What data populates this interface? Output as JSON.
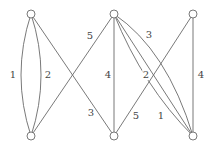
{
  "diagram": {
    "type": "bipartite-multigraph",
    "nodes": [
      {
        "id": "top-left",
        "x": 31,
        "y": 14
      },
      {
        "id": "bottom-left",
        "x": 31,
        "y": 136
      },
      {
        "id": "top-middle",
        "x": 114,
        "y": 14
      },
      {
        "id": "bottom-middle",
        "x": 114,
        "y": 136
      },
      {
        "id": "top-right",
        "x": 193,
        "y": 14
      },
      {
        "id": "bottom-right",
        "x": 193,
        "y": 136
      }
    ],
    "edges": [
      {
        "from": "top-left",
        "to": "bottom-left",
        "label": "1",
        "shape": "curve-left"
      },
      {
        "from": "top-left",
        "to": "bottom-left",
        "label": "2",
        "shape": "curve-right"
      },
      {
        "from": "top-left",
        "to": "bottom-middle",
        "label": "3",
        "shape": "straight"
      },
      {
        "from": "bottom-left",
        "to": "top-middle",
        "label": "5",
        "shape": "straight"
      },
      {
        "from": "top-middle",
        "to": "bottom-middle",
        "label": "4",
        "shape": "straight"
      },
      {
        "from": "top-middle",
        "to": "bottom-right",
        "label": "2",
        "shape": "curve-left"
      },
      {
        "from": "top-middle",
        "to": "bottom-right",
        "label": "1",
        "shape": "straight"
      },
      {
        "from": "top-middle",
        "to": "bottom-right",
        "label": "3",
        "shape": "curve-right"
      },
      {
        "from": "top-right",
        "to": "bottom-middle",
        "label": "5",
        "shape": "straight"
      },
      {
        "from": "top-right",
        "to": "bottom-right",
        "label": "4",
        "shape": "straight"
      }
    ],
    "labels": {
      "tl_bl_left": "1",
      "tl_bl_right": "2",
      "tl_bm": "3",
      "bl_tm": "5",
      "tm_bm": "4",
      "tm_br_left": "2",
      "tm_br_straight": "1",
      "tm_br_right": "3",
      "tr_bm": "5",
      "tr_br": "4"
    },
    "colors": {
      "stroke": "#6a6a6a",
      "text": "#444444",
      "background": "#ffffff"
    }
  }
}
